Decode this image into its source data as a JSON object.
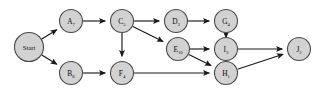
{
  "diagram": {
    "type": "directed-graph",
    "canvas": {
      "width": 326,
      "height": 92
    },
    "style": {
      "background": "#ffffff",
      "node_fill": "#d2d2d2",
      "node_stroke": "#4a4a4a",
      "edge_color": "#1a1a1a",
      "label_color": "#0d0d0d"
    },
    "nodes": [
      {
        "id": "start",
        "base": "Start",
        "sub": "",
        "label": "Start",
        "cx": 29,
        "cy": 47,
        "r": 14.5
      },
      {
        "id": "a",
        "base": "A",
        "sub": "7",
        "label": "A7",
        "cx": 71,
        "cy": 21,
        "r": 11.5
      },
      {
        "id": "b",
        "base": "B",
        "sub": "8",
        "label": "B8",
        "cx": 71,
        "cy": 73,
        "r": 11.5
      },
      {
        "id": "c",
        "base": "C",
        "sub": "5",
        "label": "C5",
        "cx": 122,
        "cy": 21,
        "r": 11.5
      },
      {
        "id": "d",
        "base": "D",
        "sub": "3",
        "label": "D3",
        "cx": 176,
        "cy": 21,
        "r": 11.5
      },
      {
        "id": "e",
        "base": "E",
        "sub": "10",
        "label": "E10",
        "cx": 178,
        "cy": 49,
        "r": 11.5
      },
      {
        "id": "f",
        "base": "F",
        "sub": "4",
        "label": "F4",
        "cx": 122,
        "cy": 73,
        "r": 11.5
      },
      {
        "id": "g",
        "base": "G",
        "sub": "4",
        "label": "G4",
        "cx": 226,
        "cy": 21,
        "r": 11.5
      },
      {
        "id": "i",
        "base": "I",
        "sub": "3",
        "label": "I3",
        "cx": 226,
        "cy": 49,
        "r": 11.5
      },
      {
        "id": "h",
        "base": "H",
        "sub": "1",
        "label": "H1",
        "cx": 226,
        "cy": 73,
        "r": 11.5
      },
      {
        "id": "j",
        "base": "J",
        "sub": "2",
        "label": "J2",
        "cx": 299,
        "cy": 49,
        "r": 11.5
      }
    ],
    "edges": [
      {
        "id": "start-a",
        "from": "start",
        "to": "a",
        "name": "edge-start-to-a"
      },
      {
        "id": "start-b",
        "from": "start",
        "to": "b",
        "name": "edge-start-to-b"
      },
      {
        "id": "a-c",
        "from": "a",
        "to": "c",
        "name": "edge-a-to-c"
      },
      {
        "id": "c-d",
        "from": "c",
        "to": "d",
        "name": "edge-c-to-d"
      },
      {
        "id": "c-e",
        "from": "c",
        "to": "e",
        "name": "edge-c-to-e"
      },
      {
        "id": "c-f",
        "from": "c",
        "to": "f",
        "name": "edge-c-to-f"
      },
      {
        "id": "d-g",
        "from": "d",
        "to": "g",
        "name": "edge-d-to-g"
      },
      {
        "id": "b-f",
        "from": "b",
        "to": "f",
        "name": "edge-b-to-f"
      },
      {
        "id": "e-i",
        "from": "e",
        "to": "i",
        "name": "edge-e-to-i"
      },
      {
        "id": "e-h",
        "from": "e",
        "to": "h",
        "name": "edge-e-to-h"
      },
      {
        "id": "f-h",
        "from": "f",
        "to": "h",
        "name": "edge-f-to-h"
      },
      {
        "id": "i-g",
        "from": "i",
        "to": "g",
        "name": "edge-i-to-g"
      },
      {
        "id": "i-j",
        "from": "i",
        "to": "j",
        "name": "edge-i-to-j"
      },
      {
        "id": "h-j",
        "from": "h",
        "to": "j",
        "name": "edge-h-to-j"
      }
    ]
  }
}
